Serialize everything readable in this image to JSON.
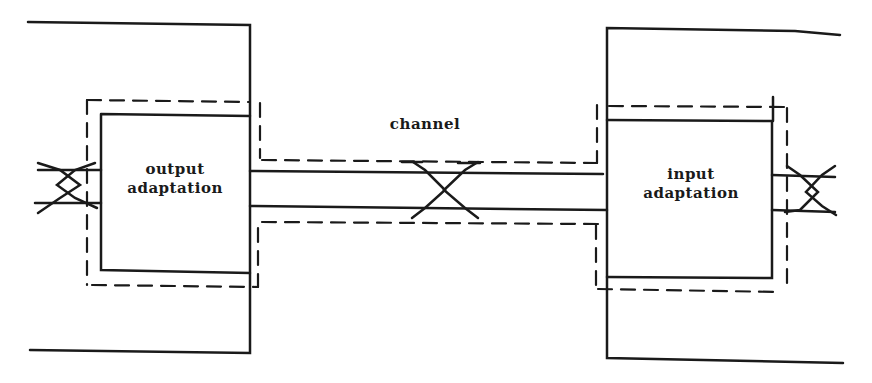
{
  "diagram": {
    "type": "block-diagram",
    "colors": {
      "stroke": "#1a1a1a",
      "background": "#ffffff"
    },
    "labels": {
      "left_block_line1": "output",
      "left_block_line2": "adaptation",
      "channel": "channel",
      "right_block_line1": "input",
      "right_block_line2": "adaptation"
    },
    "nodes": [
      {
        "id": "output-adaptation",
        "label": "output adaptation",
        "shape": "box"
      },
      {
        "id": "channel",
        "label": "channel",
        "shape": "twisted-pair-line"
      },
      {
        "id": "input-adaptation",
        "label": "input adaptation",
        "shape": "box"
      }
    ],
    "edges": [
      {
        "from": "external-left",
        "to": "output-adaptation",
        "style": "twisted-pair"
      },
      {
        "from": "output-adaptation",
        "to": "input-adaptation",
        "via": "channel",
        "style": "twisted-pair"
      },
      {
        "from": "input-adaptation",
        "to": "external-right",
        "style": "twisted-pair"
      }
    ],
    "boundaries": [
      {
        "id": "left-enclosure",
        "style": "solid"
      },
      {
        "id": "right-enclosure",
        "style": "solid"
      },
      {
        "id": "shielding-boundary",
        "style": "dashed",
        "encloses": [
          "output-adaptation",
          "channel",
          "input-adaptation"
        ]
      }
    ]
  }
}
